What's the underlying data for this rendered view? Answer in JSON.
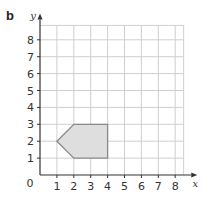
{
  "part_label": "b",
  "axes": {
    "x_label": "x",
    "y_label": "y",
    "origin_label": "0",
    "x_ticks": [
      "1",
      "2",
      "3",
      "4",
      "5",
      "6",
      "7",
      "8"
    ],
    "y_ticks": [
      "1",
      "2",
      "3",
      "4",
      "5",
      "6",
      "7",
      "8"
    ]
  },
  "grid": {
    "x_min": 0,
    "x_max": 8.5,
    "y_min": 0,
    "y_max": 9,
    "step": 1
  },
  "shape": {
    "name": "pentagon",
    "vertices": [
      [
        1,
        2
      ],
      [
        2,
        3
      ],
      [
        4,
        3
      ],
      [
        4,
        1
      ],
      [
        2,
        1
      ]
    ],
    "fill": "#dedede",
    "stroke": "#8a8a8a"
  },
  "colors": {
    "grid": "#cfcfcf",
    "axis": "#333333"
  }
}
